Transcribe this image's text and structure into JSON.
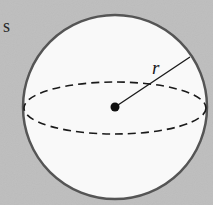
{
  "figure": {
    "partial_text": "s",
    "radius_label": "r",
    "colors": {
      "background": "#bebebe",
      "sphere_fill": "#f9f9f9",
      "outline": "#555555",
      "lines": "#1a1a1a"
    }
  }
}
